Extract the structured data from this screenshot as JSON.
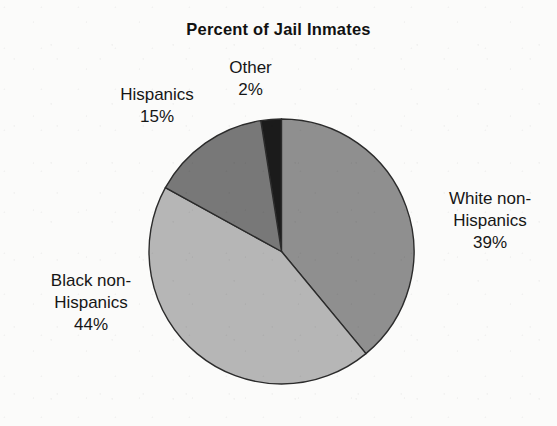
{
  "chart_data": {
    "type": "pie",
    "title": "Percent of Jail Inmates",
    "xlabel": "",
    "ylabel": "",
    "legend_position": "none",
    "grid": false,
    "units": "percent",
    "start_angle_deg": 0,
    "direction": "clockwise",
    "categories": [
      "Other",
      "White non-Hispanics",
      "Black non-Hispanics",
      "Hispanics"
    ],
    "values": [
      2,
      39,
      44,
      15
    ],
    "slices": [
      {
        "label": "Other",
        "label_line1": "Other",
        "label_line2": "",
        "value": 2,
        "value_text": "2%",
        "color": "#1b1b1b",
        "start_deg": 351,
        "end_deg": 360
      },
      {
        "label": "White non-Hispanics",
        "label_line1": "White non-",
        "label_line2": "Hispanics",
        "value": 39,
        "value_text": "39%",
        "color": "#8f8f8f",
        "start_deg": 0,
        "end_deg": 140.4
      },
      {
        "label": "Black non-Hispanics",
        "label_line1": "Black non-",
        "label_line2": "Hispanics",
        "value": 44,
        "value_text": "44%",
        "color": "#b6b6b6",
        "start_deg": 140.4,
        "end_deg": 298.8
      },
      {
        "label": "Hispanics",
        "label_line1": "Hispanics",
        "label_line2": "",
        "value": 15,
        "value_text": "15%",
        "color": "#787878",
        "start_deg": 298.8,
        "end_deg": 351
      }
    ],
    "outline_color": "#2b2b2b",
    "background_color": "#fbfbfa"
  }
}
